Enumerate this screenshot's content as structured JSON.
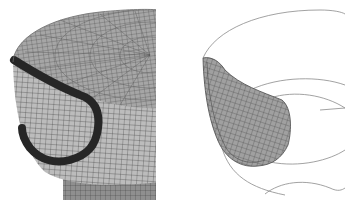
{
  "figure": {
    "panels": [
      {
        "id": "left",
        "description": "Finite element mesh of cylindrical part (top face with radial/circumferential mesh, side wall with quad mesh) showing highlighted dark band region",
        "colors": {
          "mesh_fill": "#a9a9a9",
          "mesh_line": "#3a3a3a",
          "band": "#2b2b2b",
          "side_fill": "#b8b8b8"
        }
      },
      {
        "id": "right",
        "description": "Isolated meshed sub-region (crack/insert zone) shown with wireframe outline arcs of the cylinder",
        "colors": {
          "mesh_fill": "#9c9c9c",
          "mesh_line": "#4a4a4a",
          "outline": "#8a8a8a"
        }
      }
    ]
  }
}
